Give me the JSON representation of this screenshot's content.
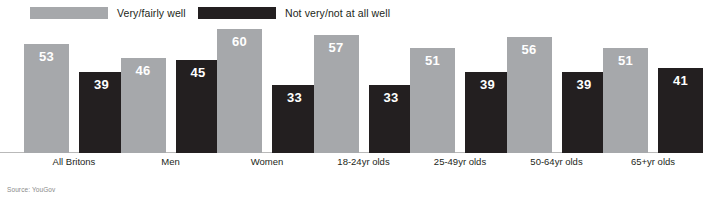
{
  "source_note": "Source: YouGov",
  "legend": {
    "items": [
      {
        "label": "Very/fairly well",
        "color": "#a6a8ab"
      },
      {
        "label": "Not very/not at all well",
        "color": "#231f20"
      }
    ]
  },
  "chart_data": {
    "type": "bar",
    "title": "",
    "xlabel": "",
    "ylabel": "",
    "ylim": [
      0,
      62
    ],
    "grid": false,
    "legend_position": "top-left",
    "categories": [
      "All Britons",
      "Men",
      "Women",
      "18-24yr olds",
      "25-49yr olds",
      "50-64yr olds",
      "65+yr olds"
    ],
    "series": [
      {
        "name": "Very/fairly well",
        "color": "#a6a8ab",
        "values": [
          53,
          46,
          60,
          57,
          51,
          56,
          51
        ]
      },
      {
        "name": "Not very/not at all well",
        "color": "#231f20",
        "values": [
          39,
          45,
          33,
          33,
          39,
          39,
          41
        ]
      }
    ]
  }
}
